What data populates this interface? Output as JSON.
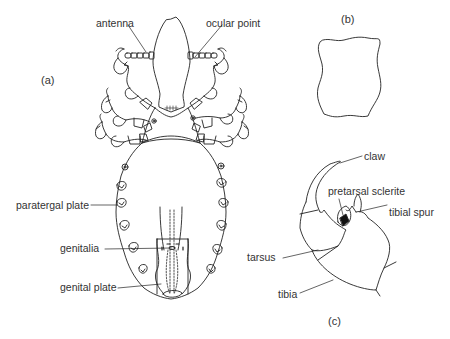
{
  "figure": {
    "panels": {
      "a": "(a)",
      "b": "(b)",
      "c": "(c)"
    },
    "labels_a": {
      "antenna": "antenna",
      "ocular_point": "ocular point",
      "paratergal_plate": "paratergal plate",
      "genitalia": "genitalia",
      "genital_plate": "genital plate"
    },
    "labels_c": {
      "claw": "claw",
      "pretarsal_sclerite": "pretarsal sclerite",
      "tibial_spur": "tibial spur",
      "tarsus": "tarsus",
      "tibia": "tibia"
    },
    "stroke_color": "#222222"
  }
}
